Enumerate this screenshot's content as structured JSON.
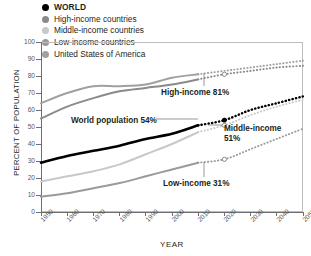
{
  "chart_data": {
    "type": "line",
    "title": "",
    "xlabel": "YEAR",
    "ylabel": "PERCENT OF POPULATION",
    "xlim": [
      1950,
      2050
    ],
    "ylim": [
      0,
      100
    ],
    "grid": false,
    "legend_position": "top-left",
    "x_ticks": [
      "1950",
      "1960",
      "1970",
      "1980",
      "1990",
      "2000",
      "2010",
      "2020",
      "2030",
      "2040",
      "2050"
    ],
    "y_ticks": [
      "0",
      "10",
      "20",
      "30",
      "40",
      "50",
      "60",
      "70",
      "80",
      "90",
      "100"
    ],
    "historical_range": [
      1950,
      2010
    ],
    "projected_range": [
      2010,
      2050
    ],
    "series": [
      {
        "name": "WORLD",
        "color": "#000000",
        "legend_dot": "#000000",
        "x": [
          1950,
          1960,
          1970,
          1980,
          1990,
          2000,
          2010,
          2020,
          2030,
          2040,
          2050
        ],
        "values": [
          29,
          33,
          36,
          39,
          43,
          46,
          51,
          54,
          60,
          64,
          68
        ],
        "projection_start": 2010,
        "marker_value": 54
      },
      {
        "name": "High-income countries",
        "color": "#8a8a8a",
        "legend_dot": "#8a8a8a",
        "x": [
          1950,
          1960,
          1970,
          1980,
          1990,
          2000,
          2010,
          2020,
          2030,
          2040,
          2050
        ],
        "values": [
          55,
          62,
          67,
          71,
          73,
          75,
          78,
          81,
          83,
          85,
          86
        ],
        "projection_start": 2010,
        "marker_value": 81
      },
      {
        "name": "Middle-income countries",
        "color": "#c8c8c8",
        "legend_dot": "#c8c8c8",
        "x": [
          1950,
          1960,
          1970,
          1980,
          1990,
          2000,
          2010,
          2020,
          2030,
          2040,
          2050
        ],
        "values": [
          18,
          21,
          24,
          28,
          34,
          40,
          47,
          51,
          57,
          62,
          66
        ],
        "projection_start": 2010,
        "marker_value": 51
      },
      {
        "name": "Low-income countries",
        "color": "#9a9a9a",
        "legend_dot": "#9a9a9a",
        "x": [
          1950,
          1960,
          1970,
          1980,
          1990,
          2000,
          2010,
          2020,
          2030,
          2040,
          2050
        ],
        "values": [
          9,
          11,
          14,
          17,
          21,
          25,
          29,
          31,
          37,
          43,
          49
        ],
        "projection_start": 2010,
        "marker_value": 31
      },
      {
        "name": "United States of America",
        "color": "#a0a0a0",
        "legend_dot": "#a0a0a0",
        "x": [
          1950,
          1960,
          1970,
          1980,
          1990,
          2000,
          2010,
          2020,
          2030,
          2040,
          2050
        ],
        "values": [
          64,
          70,
          74,
          74,
          75,
          79,
          81,
          83,
          85,
          87,
          89
        ],
        "projection_start": 2010,
        "marker_value": null
      }
    ],
    "annotations": [
      {
        "text": "High-income 81%",
        "value": 81
      },
      {
        "text": "World population 54%",
        "value": 54
      },
      {
        "text": "Middle-income 51%",
        "value": 51
      },
      {
        "text": "Low-income 31%",
        "value": 31
      }
    ]
  },
  "legend": {
    "items": [
      {
        "label": "WORLD"
      },
      {
        "label": "High-income countries"
      },
      {
        "label": "Middle-income countries"
      },
      {
        "label": "Low-income countries"
      },
      {
        "label": "United States of America"
      }
    ]
  },
  "axes": {
    "y_title": "PERCENT OF POPULATION",
    "x_title": "YEAR"
  },
  "annotations": {
    "high_income": "High-income 81%",
    "world": "World population 54%",
    "middle_income_line1": "Middle-income",
    "middle_income_line2": "51%",
    "low_income": "Low-income 31%"
  }
}
